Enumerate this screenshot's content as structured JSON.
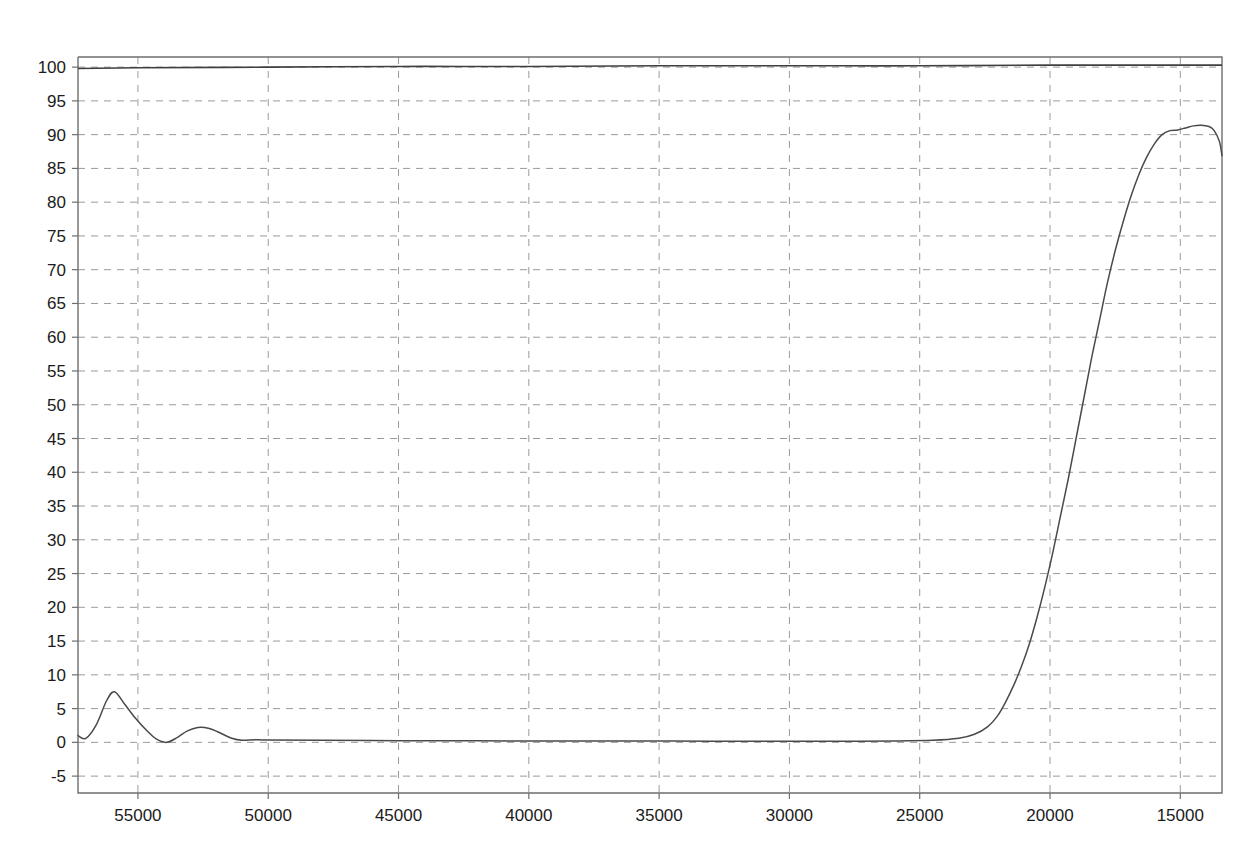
{
  "chart_data": {
    "type": "line",
    "title": "",
    "subtitle": "",
    "xlabel": "",
    "ylabel": "",
    "xlim": [
      57300,
      13400
    ],
    "ylim": [
      -7.5,
      101.5
    ],
    "x_axis_reversed": true,
    "grid": true,
    "legend": "none",
    "xticks": [
      55000,
      50000,
      45000,
      40000,
      35000,
      30000,
      25000,
      20000,
      15000
    ],
    "xtick_labels": [
      "55000",
      "50000",
      "45000",
      "40000",
      "35000",
      "30000",
      "25000",
      "20000",
      "15000"
    ],
    "yticks": [
      -5,
      0,
      5,
      10,
      15,
      20,
      25,
      30,
      35,
      40,
      45,
      50,
      55,
      60,
      65,
      70,
      75,
      80,
      85,
      90,
      95,
      100
    ],
    "ytick_labels": [
      "-5",
      "0",
      "5",
      "10",
      "15",
      "20",
      "25",
      "30",
      "35",
      "40",
      "45",
      "50",
      "55",
      "60",
      "65",
      "70",
      "75",
      "80",
      "85",
      "90",
      "95",
      "100"
    ],
    "series": [
      {
        "name": "reference-baseline",
        "color": "#3f3f3f",
        "x": [
          57300,
          55000,
          50000,
          45000,
          40000,
          35000,
          30000,
          25000,
          20000,
          17000,
          15000,
          13400
        ],
        "values": [
          99.8,
          99.9,
          100.0,
          100.1,
          100.1,
          100.2,
          100.2,
          100.2,
          100.3,
          100.3,
          100.3,
          100.3
        ]
      },
      {
        "name": "transmittance",
        "color": "#4a4a4a",
        "x": [
          57300,
          57000,
          56600,
          56200,
          55900,
          55500,
          55100,
          54700,
          54300,
          53900,
          53500,
          53100,
          52700,
          52300,
          51900,
          51400,
          51000,
          50500,
          50000,
          48000,
          45000,
          42000,
          39000,
          36000,
          33000,
          30000,
          28000,
          26000,
          24500,
          23500,
          22900,
          22400,
          22000,
          21700,
          21400,
          21100,
          20800,
          20500,
          20200,
          19900,
          19600,
          19300,
          19000,
          18700,
          18400,
          18100,
          17800,
          17500,
          17200,
          16900,
          16600,
          16300,
          16000,
          15700,
          15400,
          15100,
          14800,
          14500,
          14200,
          13900,
          13700,
          13500,
          13400
        ],
        "values": [
          1.0,
          0.6,
          2.6,
          6.2,
          7.5,
          5.6,
          3.6,
          1.9,
          0.5,
          0.0,
          0.7,
          1.7,
          2.2,
          2.1,
          1.5,
          0.6,
          0.3,
          0.4,
          0.35,
          0.3,
          0.25,
          0.22,
          0.2,
          0.2,
          0.18,
          0.18,
          0.18,
          0.2,
          0.3,
          0.6,
          1.2,
          2.3,
          4.0,
          6.0,
          8.4,
          11.2,
          14.5,
          18.5,
          23.0,
          28.0,
          33.5,
          39.0,
          45.0,
          51.0,
          57.0,
          62.5,
          68.0,
          72.8,
          77.0,
          80.8,
          84.0,
          86.6,
          88.6,
          90.0,
          90.6,
          90.7,
          91.0,
          91.3,
          91.4,
          91.2,
          90.6,
          89.0,
          86.9
        ]
      }
    ]
  },
  "plot_geometry": {
    "left": 78,
    "right": 1222,
    "top": 57,
    "bottom": 793
  }
}
